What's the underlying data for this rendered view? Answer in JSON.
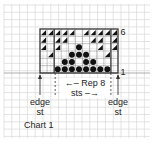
{
  "chart": {
    "title": "Chart 1",
    "columns": 11,
    "rows": 6,
    "row_labels": {
      "top": "6",
      "bottom": "1"
    },
    "repeat_label": "Rep 8 sts",
    "edge_left_label": [
      "edge",
      "st"
    ],
    "edge_right_label": [
      "edge",
      "st"
    ],
    "legend_symbols": {
      "triangle": "dark triangle (lower-right half filled)",
      "dot": "filled circle"
    },
    "grid_rows": [
      {
        "row": 6,
        "cells": [
          "t",
          "t",
          "t",
          "t",
          "t",
          "",
          "t",
          "t",
          "t",
          "t",
          "t"
        ]
      },
      {
        "row": 5,
        "cells": [
          "t",
          "",
          "t",
          "t",
          "",
          "",
          "",
          "t",
          "t",
          "",
          "t"
        ]
      },
      {
        "row": 4,
        "cells": [
          "t",
          "",
          "t",
          "",
          "",
          "d",
          "",
          "",
          "t",
          "",
          "t"
        ]
      },
      {
        "row": 3,
        "cells": [
          "",
          "t",
          "",
          "",
          "d",
          "d",
          "d",
          "",
          "",
          "t",
          ""
        ]
      },
      {
        "row": 2,
        "cells": [
          "",
          "",
          "",
          "d",
          "d",
          "",
          "d",
          "d",
          "",
          "",
          ""
        ]
      },
      {
        "row": 1,
        "cells": [
          "",
          "",
          "d",
          "d",
          "d",
          "d",
          "d",
          "d",
          "d",
          "d",
          ""
        ]
      }
    ]
  },
  "colors": {
    "grid_line": "#d8d8d8",
    "chart_border": "#333333",
    "symbol": "#111111",
    "text": "#222222"
  }
}
